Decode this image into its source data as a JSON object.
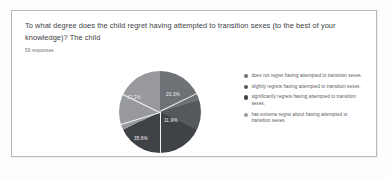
{
  "card": {
    "question": "To what degree does the child regret having attempted to transition sexes (to the best of your knowledge)? The child",
    "responses": "59 responses"
  },
  "chart_data": {
    "type": "pie",
    "title": "To what degree does the child regret having attempted to transition sexes (to the best of your knowledge)? The child",
    "subtitle": "59 responses",
    "categories": [
      "does not regret having attempted to transition sexes.",
      "slightly regrets having attempted to transition sexes.",
      "significantly regrets having attempted to transition sexes.",
      "has extreme regret about having attempted to transition sexes."
    ],
    "values": [
      20.3,
      11.9,
      35.6,
      32.2
    ],
    "value_labels": [
      "20.3%",
      "11.9%",
      "35.6%",
      "32.2%"
    ],
    "counts": [
      12,
      7,
      21,
      19
    ],
    "total_responses": 59,
    "unit": "percent",
    "legend_position": "right",
    "colors": [
      "#6e7175",
      "#55585c",
      "#3f4246",
      "#97999c"
    ],
    "grid": false
  },
  "legend": {
    "items": [
      {
        "label": "does not regret having attempted to transition sexes.",
        "color": "#6e7175"
      },
      {
        "label": "slightly regrets having attempted to transition sexes.",
        "color": "#55585c"
      },
      {
        "label": "significantly regrets having attempted to transition sexes.",
        "color": "#3f4246"
      },
      {
        "label": "has extreme regret about having attempted to transition sexes.",
        "color": "#97999c"
      }
    ]
  }
}
